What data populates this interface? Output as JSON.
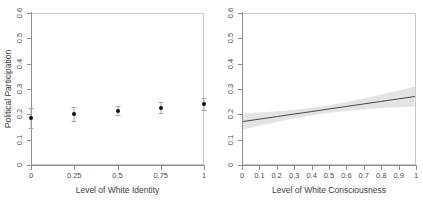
{
  "figure": {
    "background_color": "#ffffff",
    "axis_color": "#8d8d8d",
    "box_color": "#c9c9c9",
    "point_color": "#111111",
    "ci_color": "#a8a8a8",
    "band_color": "#d9d9d9",
    "line_color": "#444444"
  },
  "chart_data": [
    {
      "type": "scatter",
      "panel": "left",
      "title": "",
      "xlabel": "Level of White Identity",
      "ylabel": "Political Participation",
      "xlim": [
        0,
        1
      ],
      "ylim": [
        0,
        0.6
      ],
      "grid": false,
      "legend": "none",
      "xticks": [
        0,
        0.25,
        0.5,
        0.75,
        1
      ],
      "xticklabels": [
        "0",
        "0.25",
        "0.5",
        "0.75",
        "1"
      ],
      "yticks": [
        0,
        0.1,
        0.2,
        0.3,
        0.4,
        0.5,
        0.6
      ],
      "yticklabels": [
        "0",
        "0.1",
        "0.2",
        "0.3",
        "0.4",
        "0.5",
        "0.6"
      ],
      "x": [
        0,
        0.25,
        0.5,
        0.75,
        1
      ],
      "values": [
        0.186,
        0.2,
        0.212,
        0.225,
        0.24
      ],
      "ci_lower": [
        0.148,
        0.175,
        0.196,
        0.205,
        0.216
      ],
      "ci_upper": [
        0.224,
        0.227,
        0.231,
        0.248,
        0.266
      ],
      "marker": "filled-circle",
      "errorbar": "vertical-with-caps"
    },
    {
      "type": "line",
      "panel": "right",
      "title": "",
      "xlabel": "Level of White Consciousness",
      "ylabel": "",
      "xlim": [
        0,
        1
      ],
      "ylim": [
        0,
        0.6
      ],
      "grid": false,
      "legend": "none",
      "xticks": [
        0,
        0.1,
        0.2,
        0.3,
        0.4,
        0.5,
        0.6,
        0.7,
        0.8,
        0.9,
        1
      ],
      "xticklabels": [
        "0",
        "0.1",
        "0.2",
        "0.3",
        "0.4",
        "0.5",
        "0.6",
        "0.7",
        "0.8",
        "0.9",
        "1"
      ],
      "yticks": [
        0,
        0.1,
        0.2,
        0.3,
        0.4,
        0.5,
        0.6
      ],
      "yticklabels": [
        "0",
        "0.1",
        "0.2",
        "0.3",
        "0.4",
        "0.5",
        "0.6"
      ],
      "x": [
        0,
        0.1,
        0.2,
        0.3,
        0.4,
        0.5,
        0.6,
        0.7,
        0.8,
        0.9,
        1
      ],
      "values": [
        0.17,
        0.18,
        0.19,
        0.2,
        0.21,
        0.22,
        0.23,
        0.24,
        0.25,
        0.26,
        0.27
      ],
      "ci_lower": [
        0.138,
        0.154,
        0.169,
        0.183,
        0.195,
        0.205,
        0.212,
        0.218,
        0.223,
        0.227,
        0.23
      ],
      "ci_upper": [
        0.202,
        0.206,
        0.211,
        0.217,
        0.225,
        0.235,
        0.248,
        0.262,
        0.277,
        0.293,
        0.31
      ],
      "band": "confidence-interval-shaded"
    }
  ]
}
